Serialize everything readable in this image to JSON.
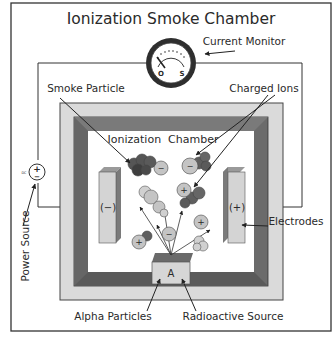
{
  "title": "Ionization Smoke Chamber",
  "labels": {
    "current_monitor": "Current Monitor",
    "smoke_particle": "Smoke Particle",
    "charged_ions": "Charged Ions",
    "ionization_chamber": "Ionization  Chamber",
    "electrodes": "Electrodes",
    "power_source": "Power Source",
    "alpha_particles": "Alpha Particles",
    "radioactive_source": "Radioactive Source",
    "dc": "DC"
  },
  "meter": {
    "zero_mark": "O",
    "scale_mark": "S"
  },
  "electrodes": {
    "negative": "(−)",
    "positive": "(+)"
  },
  "battery": {
    "plus": "+",
    "minus": "−"
  },
  "source": {
    "letter": "A"
  },
  "ion_symbols": {
    "plus": "+",
    "minus": "−"
  },
  "colors": {
    "outer_frame": "#d9d9d9",
    "inner_frame": "#6e6e6e",
    "electrode": "#d4d4d4",
    "smoke_dark": "#5e5e5e",
    "smoke_light": "#c8c8c8",
    "ion": "#bdbdbd"
  }
}
